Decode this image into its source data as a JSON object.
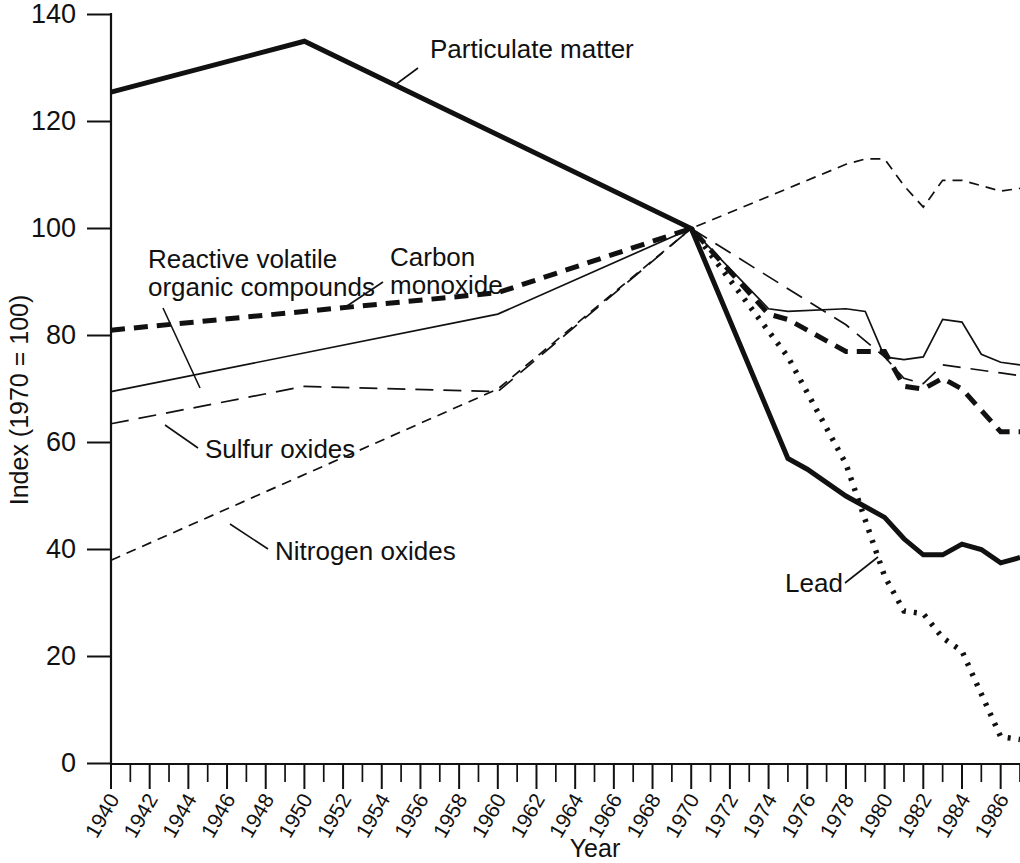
{
  "chart_data": {
    "type": "line",
    "title": "",
    "xlabel": "Year",
    "ylabel": "Index (1970 = 100)",
    "xlim": [
      1940,
      1987
    ],
    "ylim": [
      0,
      140
    ],
    "grid": false,
    "legend_position": "inline-annotations",
    "y_ticks": [
      0,
      20,
      40,
      60,
      80,
      100,
      120,
      140
    ],
    "y_tick_labels": [
      "0",
      "20",
      "40",
      "60",
      "80",
      "100",
      "120",
      "140"
    ],
    "x_minor_tick_step": 1,
    "x_ticks": [
      1940,
      1942,
      1944,
      1946,
      1948,
      1950,
      1952,
      1954,
      1956,
      1958,
      1960,
      1962,
      1964,
      1966,
      1968,
      1970,
      1972,
      1974,
      1976,
      1978,
      1980,
      1982,
      1984,
      1986
    ],
    "x_tick_labels": [
      "1940",
      "1942",
      "1944",
      "1946",
      "1948",
      "1950",
      "1952",
      "1954",
      "1956",
      "1958",
      "1960",
      "1962",
      "1964",
      "1966",
      "1968",
      "1970",
      "1972",
      "1974",
      "1976",
      "1978",
      "1980",
      "1982",
      "1984",
      "1986"
    ],
    "series": [
      {
        "name": "Particulate matter",
        "style": "solid-thick",
        "stroke_width": 5,
        "dash": "none",
        "x": [
          1940,
          1950,
          1970,
          1975,
          1976,
          1978,
          1980,
          1981,
          1982,
          1983,
          1984,
          1985,
          1986,
          1987
        ],
        "values": [
          125.5,
          135,
          100,
          57,
          55,
          50,
          46,
          42,
          39,
          39,
          41,
          40,
          37.5,
          38.5
        ]
      },
      {
        "name": "Carbon monoxide",
        "style": "solid-thin",
        "stroke_width": 1.7,
        "dash": "none",
        "x": [
          1940,
          1960,
          1970,
          1974,
          1975,
          1978,
          1979,
          1980,
          1981,
          1982,
          1983,
          1984,
          1985,
          1986,
          1987
        ],
        "values": [
          69.5,
          84,
          100,
          85,
          84.5,
          85,
          84.5,
          76,
          75.5,
          76,
          83,
          82.5,
          76.5,
          75,
          74.5
        ]
      },
      {
        "name": "Reactive volatile organic compounds",
        "style": "dashed-thick",
        "stroke_width": 5,
        "dash": "14 9",
        "x": [
          1940,
          1960,
          1970,
          1974,
          1975,
          1977,
          1978,
          1980,
          1981,
          1982,
          1983,
          1984,
          1985,
          1986,
          1987
        ],
        "values": [
          81,
          88,
          100,
          84,
          83,
          79,
          77,
          77,
          70.5,
          70,
          72,
          70,
          66,
          62,
          62
        ]
      },
      {
        "name": "Sulfur oxides",
        "style": "dashed-thin-long",
        "stroke_width": 1.7,
        "dash": "18 10",
        "x": [
          1940,
          1950,
          1960,
          1970,
          1978,
          1979,
          1980,
          1981,
          1982,
          1983,
          1984,
          1985,
          1986,
          1987
        ],
        "values": [
          63.5,
          70.5,
          69.5,
          100,
          82,
          79,
          76,
          72,
          71,
          74.5,
          74,
          73.5,
          73,
          72.5
        ]
      },
      {
        "name": "Nitrogen oxides",
        "style": "dashed-thin-short",
        "stroke_width": 1.7,
        "dash": "10 7",
        "x": [
          1940,
          1960,
          1970,
          1978,
          1979,
          1980,
          1981,
          1982,
          1983,
          1984,
          1985,
          1986,
          1987
        ],
        "values": [
          38,
          70,
          100,
          112,
          113,
          113,
          108,
          104,
          109,
          109,
          108,
          107,
          107.5
        ]
      },
      {
        "name": "Lead",
        "style": "dotted-thick",
        "stroke_width": 5.5,
        "dash": "3 8",
        "x": [
          1970,
          1975,
          1978,
          1980,
          1981,
          1982,
          1983,
          1984,
          1985,
          1986,
          1987
        ],
        "values": [
          100,
          76,
          56,
          35,
          28.5,
          28,
          23.5,
          21,
          13,
          5,
          4.5
        ]
      }
    ],
    "annotations": [
      {
        "label": "Particulate matter",
        "text_x": 430,
        "text_y": 58,
        "leader": [
          [
            418,
            68
          ],
          [
            395,
            85
          ]
        ]
      },
      {
        "label": "Reactive volatile",
        "text_x": 148,
        "text_y": 268,
        "leader": []
      },
      {
        "label": "organic compounds",
        "text_x": 148,
        "text_y": 296,
        "leader": [
          [
            163,
            308
          ],
          [
            200,
            388
          ]
        ]
      },
      {
        "label": "Carbon",
        "text_x": 390,
        "text_y": 266,
        "leader": []
      },
      {
        "label": "monoxide",
        "text_x": 390,
        "text_y": 294,
        "leader": [
          [
            383,
            282
          ],
          [
            347,
            306
          ]
        ]
      },
      {
        "label": "Sulfur oxides",
        "text_x": 205,
        "text_y": 458,
        "leader": [
          [
            198,
            448
          ],
          [
            165,
            425
          ]
        ]
      },
      {
        "label": "Nitrogen oxides",
        "text_x": 275,
        "text_y": 560,
        "leader": [
          [
            268,
            549
          ],
          [
            230,
            524
          ]
        ]
      },
      {
        "label": "Lead",
        "text_x": 785,
        "text_y": 592,
        "leader": [
          [
            845,
            583
          ],
          [
            878,
            557
          ]
        ]
      }
    ]
  },
  "axes": {
    "y_label": "Index (1970 = 100)",
    "x_label": "Year"
  },
  "colors": {
    "ink": "#111111",
    "background": "#ffffff"
  }
}
